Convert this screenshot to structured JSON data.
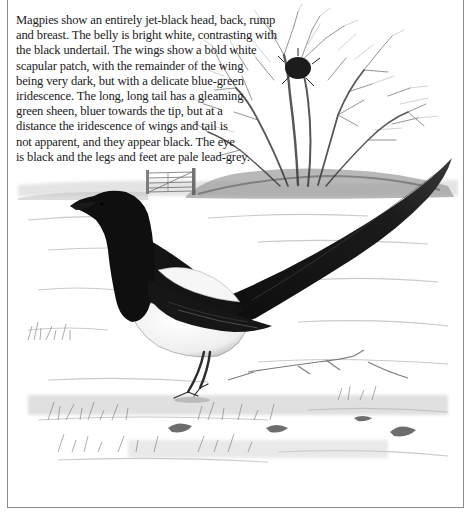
{
  "page": {
    "cut_off_line": "Features of Adult Magpie"
  },
  "caption": {
    "lines": [
      "Magpies show an entirely jet-black head, back, rump",
      "and breast. The belly is bright white, contrasting with",
      "the black undertail. The wings show a bold white",
      "scapular patch, with the remainder of the wing",
      "being very dark, but with a delicate blue-green",
      "iridescence. The long, long tail has a gleaming",
      "green sheen, bluer towards the tip, but at a",
      "distance the iridescence of wings and tail is",
      "not apparent, and they appear black. The eye",
      "is black and the legs and feet are pale lead-grey."
    ]
  },
  "illustration": {
    "subject": "magpie",
    "elements": [
      "bare-tree-with-nest",
      "field-gate",
      "snowy-field",
      "grass-tufts",
      "twigs"
    ],
    "colors": {
      "bird_black": "#111111",
      "bird_white": "#f4f4f4",
      "pencil_grey": "#7a7a7a",
      "frame": "#8a8a8a"
    }
  }
}
